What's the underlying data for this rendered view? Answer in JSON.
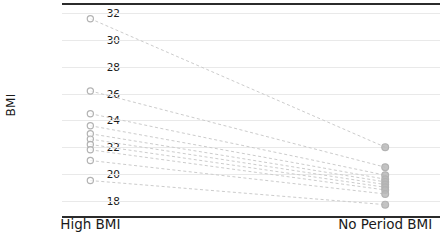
{
  "chart_data": {
    "type": "line",
    "subtype": "paired-slope-plot",
    "title": "",
    "xlabel": "",
    "ylabel": "BMI",
    "categories": [
      "High BMI",
      "No Period BMI"
    ],
    "ylim": [
      17.3,
      32.4
    ],
    "yticks": [
      18,
      20,
      22,
      24,
      26,
      28,
      30,
      32
    ],
    "ytick_labels": [
      "18",
      "20",
      "22",
      "24",
      "26",
      "28",
      "30",
      "32"
    ],
    "grid": true,
    "legend": "none",
    "series": [
      {
        "name": "subject-01",
        "values": [
          31.6,
          22.0
        ]
      },
      {
        "name": "subject-02",
        "values": [
          26.2,
          20.5
        ]
      },
      {
        "name": "subject-03",
        "values": [
          24.5,
          19.9
        ]
      },
      {
        "name": "subject-04",
        "values": [
          23.6,
          19.6
        ]
      },
      {
        "name": "subject-05",
        "values": [
          23.0,
          19.4
        ]
      },
      {
        "name": "subject-06",
        "values": [
          22.6,
          19.2
        ]
      },
      {
        "name": "subject-07",
        "values": [
          22.2,
          19.0
        ]
      },
      {
        "name": "subject-08",
        "values": [
          21.8,
          18.8
        ]
      },
      {
        "name": "subject-09",
        "values": [
          21.0,
          18.5
        ]
      },
      {
        "name": "subject-10",
        "values": [
          19.5,
          17.7
        ]
      }
    ],
    "marker": "circle-open",
    "marker_color": "#b3b3b3",
    "line_color": "#cccccc",
    "line_style": "dashed",
    "axis_color": "#2b2b2b",
    "grid_color": "#e9e9e9",
    "background": "#ffffff"
  }
}
